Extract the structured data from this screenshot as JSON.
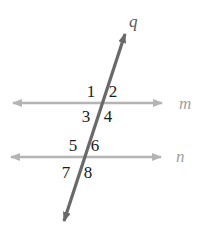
{
  "diagram": {
    "colors": {
      "background": "#ffffff",
      "parallel_line": "#b4b4b4",
      "transversal_line": "#696969",
      "parallel_label": "#9f9f9f",
      "transversal_label": "#585858",
      "angle_text": "#1b1b1b"
    },
    "transversal": {
      "label": "q"
    },
    "parallel_lines": [
      {
        "label": "m"
      },
      {
        "label": "n"
      }
    ],
    "angle_labels": [
      "1",
      "2",
      "3",
      "4",
      "5",
      "6",
      "7",
      "8"
    ]
  }
}
